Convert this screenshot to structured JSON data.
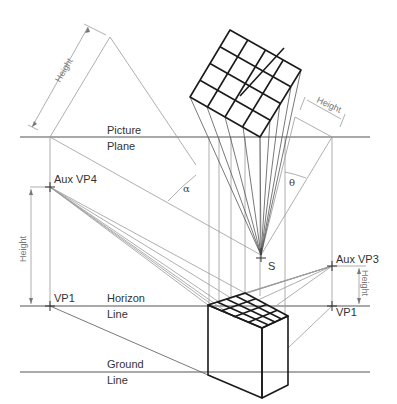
{
  "diagram": {
    "title": "",
    "labels": {
      "picture_plane_1": "Picture",
      "picture_plane_2": "Plane",
      "horizon_1": "Horizon",
      "horizon_2": "Line",
      "ground_1": "Ground",
      "ground_2": "Line",
      "aux_vp4": "Aux VP4",
      "aux_vp3": "Aux VP3",
      "vp1_left": "VP1",
      "vp1_right": "VP1",
      "station_point": "S",
      "alpha": "α",
      "theta": "θ",
      "height_top_left": "Height",
      "height_top_right": "Height",
      "height_left": "Height",
      "height_right": "Height"
    },
    "colors": {
      "line": "#555555",
      "thin_line": "#9a9a9a",
      "bold_edge": "#1a1a1a",
      "face_fill": "#ececec",
      "background": "#ffffff"
    },
    "grid": {
      "rows": 4,
      "cols": 4
    }
  }
}
